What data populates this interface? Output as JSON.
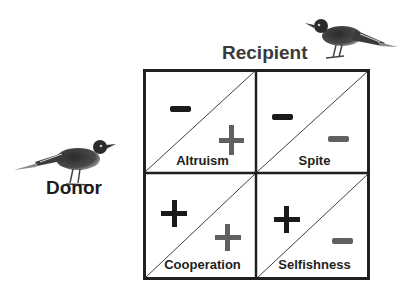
{
  "labels": {
    "recipient": "Recipient",
    "donor": "Donor"
  },
  "matrix": {
    "cells": [
      {
        "name": "Altruism",
        "donor_sign": "−",
        "recipient_sign": "+"
      },
      {
        "name": "Spite",
        "donor_sign": "−",
        "recipient_sign": "−"
      },
      {
        "name": "Cooperation",
        "donor_sign": "+",
        "recipient_sign": "+"
      },
      {
        "name": "Selfishness",
        "donor_sign": "+",
        "recipient_sign": "−"
      }
    ]
  },
  "colors": {
    "border": "#1f1f1f",
    "donor_sign": "#1a1a1a",
    "recipient_sign": "#606060",
    "diagonal": "#2a2a2a"
  },
  "images": {
    "top_bird": "bird-photo",
    "left_bird": "bird-photo"
  }
}
